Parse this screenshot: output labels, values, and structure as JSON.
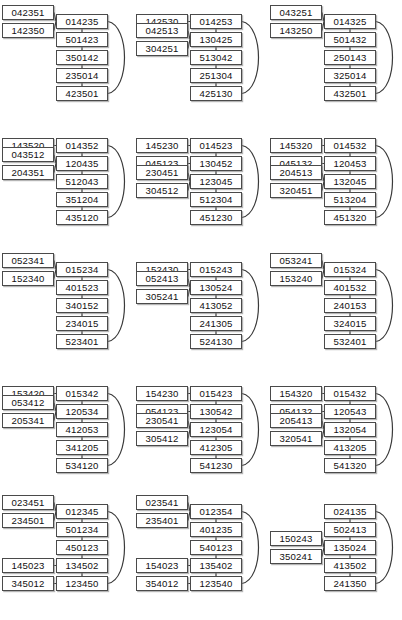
{
  "figure": {
    "type": "permutation-graph-grid",
    "rows": 5,
    "columns": 3,
    "node_count_per_panel": 7,
    "colors": {
      "background": "#ffffff",
      "node_border": "#4a4a4a",
      "node_fill": "#ffffff",
      "node_text": "#111111",
      "edge": "#3a3a3a",
      "node_shadow": "#787878"
    }
  },
  "panels": [
    {
      "id": "panel-r1c1",
      "row": 1,
      "column": 1,
      "spine": [
        "014235",
        "501423",
        "350142",
        "235014",
        "423501"
      ],
      "branches": [
        {
          "labels": [
            "042351",
            "142350"
          ],
          "attach_index": 0
        }
      ],
      "wrap_edge": {
        "from_index": 0,
        "to_index": 4
      }
    },
    {
      "id": "panel-r1c2",
      "row": 1,
      "column": 2,
      "spine": [
        "014253",
        "130425",
        "513042",
        "251304",
        "425130"
      ],
      "branches": [
        {
          "labels": [
            "142530"
          ],
          "attach_index": 0
        },
        {
          "labels": [
            "042513",
            "304251"
          ],
          "attach_index": 1
        }
      ],
      "wrap_edge": {
        "from_index": 0,
        "to_index": 4
      }
    },
    {
      "id": "panel-r1c3",
      "row": 1,
      "column": 3,
      "spine": [
        "014325",
        "501432",
        "250143",
        "325014",
        "432501"
      ],
      "branches": [
        {
          "labels": [
            "043251",
            "143250"
          ],
          "attach_index": 0
        }
      ],
      "wrap_edge": {
        "from_index": 0,
        "to_index": 4
      }
    },
    {
      "id": "panel-r2c1",
      "row": 2,
      "column": 1,
      "spine": [
        "014352",
        "120435",
        "512043",
        "351204",
        "435120"
      ],
      "branches": [
        {
          "labels": [
            "143520"
          ],
          "attach_index": 0
        },
        {
          "labels": [
            "043512",
            "204351"
          ],
          "attach_index": 1
        }
      ],
      "wrap_edge": {
        "from_index": 0,
        "to_index": 4
      }
    },
    {
      "id": "panel-r2c2",
      "row": 2,
      "column": 2,
      "spine": [
        "014523",
        "130452",
        "123045",
        "512304",
        "451230"
      ],
      "branches": [
        {
          "labels": [
            "145230"
          ],
          "attach_index": 0
        },
        {
          "labels": [
            "045123"
          ],
          "attach_index": 1
        },
        {
          "labels": [
            "230451",
            "304512"
          ],
          "attach_index": 2
        }
      ],
      "wrap_edge": {
        "from_index": 0,
        "to_index": 4
      }
    },
    {
      "id": "panel-r2c3",
      "row": 2,
      "column": 3,
      "spine": [
        "014532",
        "120453",
        "132045",
        "513204",
        "451320"
      ],
      "branches": [
        {
          "labels": [
            "145320"
          ],
          "attach_index": 0
        },
        {
          "labels": [
            "045132"
          ],
          "attach_index": 1
        },
        {
          "labels": [
            "204513",
            "320451"
          ],
          "attach_index": 2
        }
      ],
      "wrap_edge": {
        "from_index": 0,
        "to_index": 4
      }
    },
    {
      "id": "panel-r3c1",
      "row": 3,
      "column": 1,
      "spine": [
        "015234",
        "401523",
        "340152",
        "234015",
        "523401"
      ],
      "branches": [
        {
          "labels": [
            "052341",
            "152340"
          ],
          "attach_index": 0
        }
      ],
      "wrap_edge": {
        "from_index": 0,
        "to_index": 4
      }
    },
    {
      "id": "panel-r3c2",
      "row": 3,
      "column": 2,
      "spine": [
        "015243",
        "130524",
        "413052",
        "241305",
        "524130"
      ],
      "branches": [
        {
          "labels": [
            "152430"
          ],
          "attach_index": 0
        },
        {
          "labels": [
            "052413",
            "305241"
          ],
          "attach_index": 1
        }
      ],
      "wrap_edge": {
        "from_index": 0,
        "to_index": 4
      }
    },
    {
      "id": "panel-r3c3",
      "row": 3,
      "column": 3,
      "spine": [
        "015324",
        "401532",
        "240153",
        "324015",
        "532401"
      ],
      "branches": [
        {
          "labels": [
            "053241",
            "153240"
          ],
          "attach_index": 0
        }
      ],
      "wrap_edge": {
        "from_index": 0,
        "to_index": 4
      }
    },
    {
      "id": "panel-r4c1",
      "row": 4,
      "column": 1,
      "spine": [
        "015342",
        "120534",
        "412053",
        "341205",
        "534120"
      ],
      "branches": [
        {
          "labels": [
            "153420"
          ],
          "attach_index": 0
        },
        {
          "labels": [
            "053412",
            "205341"
          ],
          "attach_index": 1
        }
      ],
      "wrap_edge": {
        "from_index": 0,
        "to_index": 4
      }
    },
    {
      "id": "panel-r4c2",
      "row": 4,
      "column": 2,
      "spine": [
        "015423",
        "130542",
        "123054",
        "412305",
        "541230"
      ],
      "branches": [
        {
          "labels": [
            "154230"
          ],
          "attach_index": 0
        },
        {
          "labels": [
            "054123"
          ],
          "attach_index": 1
        },
        {
          "labels": [
            "230541",
            "305412"
          ],
          "attach_index": 2
        }
      ],
      "wrap_edge": {
        "from_index": 0,
        "to_index": 4
      }
    },
    {
      "id": "panel-r4c3",
      "row": 4,
      "column": 3,
      "spine": [
        "015432",
        "120543",
        "132054",
        "413205",
        "541320"
      ],
      "branches": [
        {
          "labels": [
            "154320"
          ],
          "attach_index": 0
        },
        {
          "labels": [
            "054132"
          ],
          "attach_index": 1
        },
        {
          "labels": [
            "205413",
            "320541"
          ],
          "attach_index": 2
        }
      ],
      "wrap_edge": {
        "from_index": 0,
        "to_index": 4
      }
    },
    {
      "id": "panel-r5c1",
      "row": 5,
      "column": 1,
      "spine": [
        "012345",
        "501234",
        "450123",
        "134502",
        "123450"
      ],
      "branches": [
        {
          "labels": [
            "023451",
            "234501"
          ],
          "attach_index": 0
        },
        {
          "labels": [
            "145023"
          ],
          "attach_index": 3
        },
        {
          "labels": [
            "345012"
          ],
          "attach_index": 4
        }
      ],
      "wrap_edge": {
        "from_index": 0,
        "to_index": 4
      }
    },
    {
      "id": "panel-r5c2",
      "row": 5,
      "column": 2,
      "spine": [
        "012354",
        "401235",
        "540123",
        "135402",
        "123540"
      ],
      "branches": [
        {
          "labels": [
            "023541",
            "235401"
          ],
          "attach_index": 0
        },
        {
          "labels": [
            "154023"
          ],
          "attach_index": 3
        },
        {
          "labels": [
            "354012"
          ],
          "attach_index": 4
        }
      ],
      "wrap_edge": {
        "from_index": 0,
        "to_index": 4
      }
    },
    {
      "id": "panel-r5c3",
      "row": 5,
      "column": 3,
      "spine": [
        "024135",
        "502413",
        "135024",
        "413502",
        "241350"
      ],
      "branches": [
        {
          "labels": [
            "150243",
            "350241"
          ],
          "attach_index": 2
        }
      ],
      "wrap_edge": {
        "from_index": 0,
        "to_index": 4
      }
    }
  ]
}
